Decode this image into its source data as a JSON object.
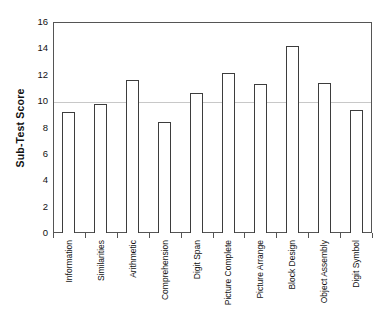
{
  "chart_data": {
    "type": "bar",
    "title": "",
    "xlabel": "",
    "ylabel": "Sub-Test Score",
    "categories": [
      "Information",
      "Similarities",
      "Arithmetic",
      "Comprehension",
      "Digit Span",
      "Picture Complete",
      "Picture Arrange",
      "Block Design",
      "Object Assembly",
      "Digit Symbol"
    ],
    "values": [
      9.2,
      9.8,
      11.6,
      8.4,
      10.6,
      12.1,
      11.3,
      14.2,
      11.4,
      9.3
    ],
    "ylim": [
      0,
      16
    ],
    "ytick_labels": [
      "0",
      "2",
      "4",
      "6",
      "8",
      "10",
      "12",
      "14",
      "16"
    ],
    "ytick_values": [
      0,
      2,
      4,
      6,
      8,
      10,
      12,
      14,
      16
    ],
    "grid": true,
    "gridlines_at": [
      10
    ],
    "legend": null,
    "legend_position": "none",
    "bar_fill_color": "#ffffff",
    "bar_edge_color": "#3d3d3d",
    "gridline_color": "#c8c8c8",
    "axis_color": "#555555",
    "background_color": "#ffffff"
  }
}
